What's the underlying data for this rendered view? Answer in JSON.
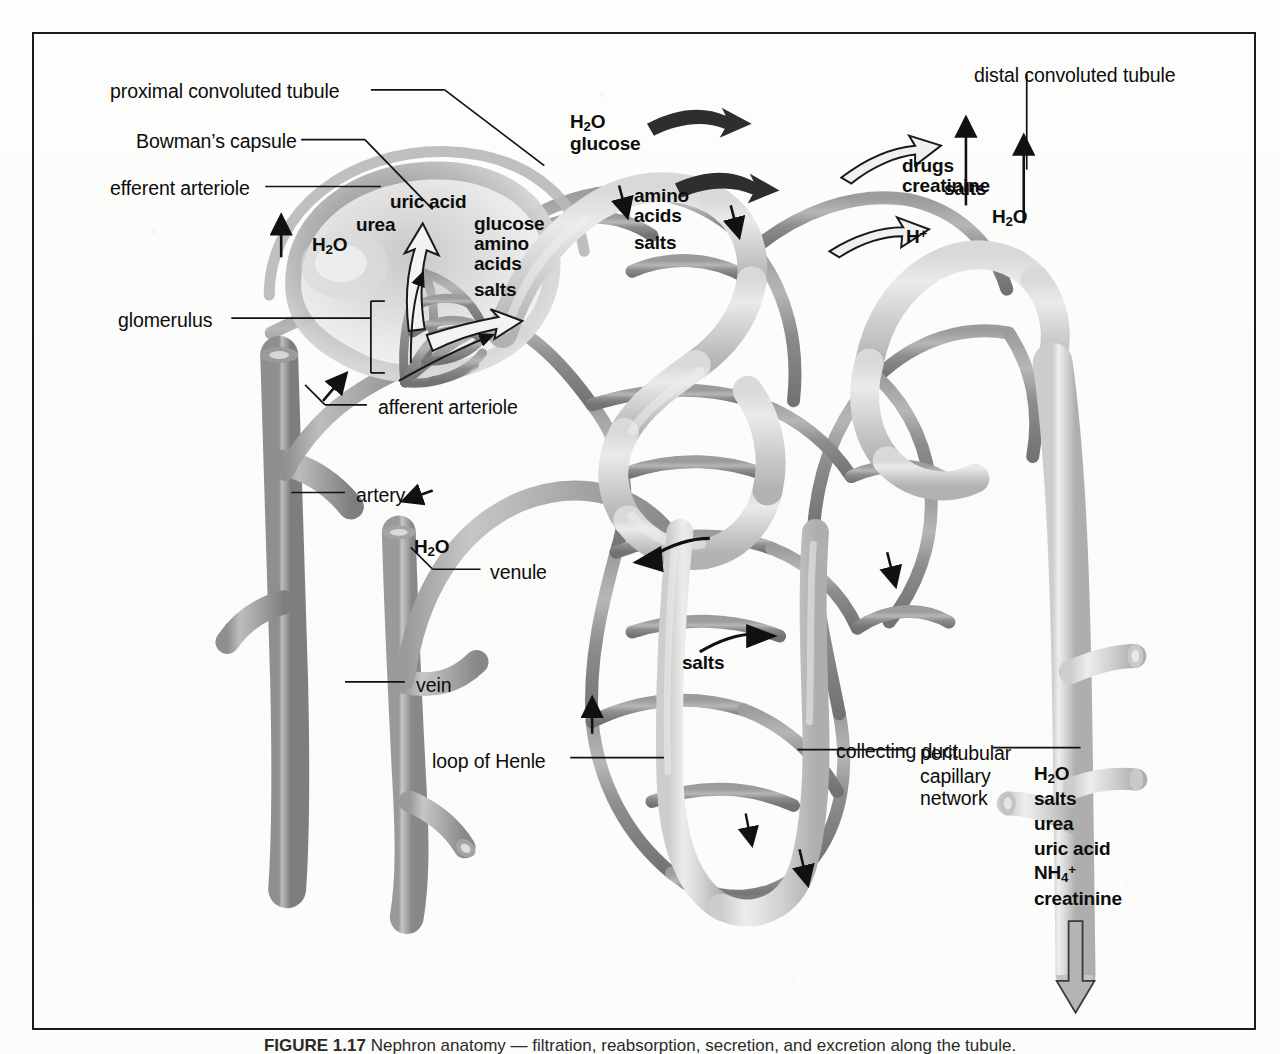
{
  "figure": {
    "frame_color": "#1b1b1b",
    "background_color": "#fefefe",
    "capillary_color": "#8c8c8c",
    "tubule_color": "#c9c9c9",
    "vessel_color": "#a8a8a8",
    "arrow_color": "#111111"
  },
  "labels": {
    "proximal_convoluted_tubule": "proximal convoluted tubule",
    "bowmans_capsule": "Bowman’s capsule",
    "efferent_arteriole": "efferent arteriole",
    "glomerulus": "glomerulus",
    "afferent_arteriole": "afferent arteriole",
    "artery": "artery",
    "venule": "venule",
    "vein": "vein",
    "loop_of_henle": "loop of Henle",
    "distal_convoluted_tubule": "distal convoluted tubule",
    "collecting_duct": "collecting duct",
    "peritubular_capillary_network_line1": "peritubular",
    "peritubular_capillary_network_line2": "capillary",
    "peritubular_capillary_network_line3": "network"
  },
  "filtration": {
    "heading": "substances filtered at the glomerulus",
    "left_group": [
      "H",
      "urea",
      "uric acid"
    ],
    "water": "H",
    "water_sub": "2",
    "water_suffix": "O",
    "urea": "urea",
    "uric_acid": "uric acid",
    "glucose": "glucose",
    "amino": "amino",
    "acids": "acids",
    "salts": "salts"
  },
  "reabsorption_pct": {
    "water_glucose_h2o": "H",
    "water_glucose_sub": "2",
    "water_glucose_suffix": "O",
    "glucose": "glucose",
    "amino": "amino",
    "acids": "acids",
    "salts": "salts"
  },
  "secretion": {
    "drugs": "drugs",
    "creatinine": "creatinine",
    "hydrogen_ion_base": "H",
    "hydrogen_ion_sup": "+"
  },
  "distal_transport": {
    "salts": "salts",
    "water_base": "H",
    "water_sub": "2",
    "water_suffix": "O"
  },
  "henle_transport": {
    "water_base": "H",
    "water_sub": "2",
    "water_suffix": "O",
    "salts": "salts"
  },
  "excreted": {
    "water_base": "H",
    "water_sub": "2",
    "water_suffix": "O",
    "salts": "salts",
    "urea": "urea",
    "uric_acid": "uric acid",
    "ammonium_base": "NH",
    "ammonium_sub": "4",
    "ammonium_sup": "+",
    "creatinine": "creatinine"
  },
  "caption": {
    "figure_number": "FIGURE 1.17",
    "text": "Nephron anatomy — filtration, reabsorption, secretion, and excretion along the tubule."
  }
}
